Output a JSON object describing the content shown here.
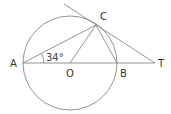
{
  "diagram": {
    "type": "geometry",
    "points": {
      "A": {
        "label": "A",
        "x": 23,
        "y": 63
      },
      "O": {
        "label": "O",
        "x": 70,
        "y": 63
      },
      "B": {
        "label": "B",
        "x": 117,
        "y": 63
      },
      "C": {
        "label": "C",
        "x": 96,
        "y": 25
      },
      "T": {
        "label": "T",
        "x": 155,
        "y": 63
      }
    },
    "circle": {
      "cx": 70,
      "cy": 63,
      "r": 47
    },
    "angle_label": "34°",
    "segments": [
      "AC",
      "OC",
      "BC",
      "AT",
      "CT"
    ]
  }
}
